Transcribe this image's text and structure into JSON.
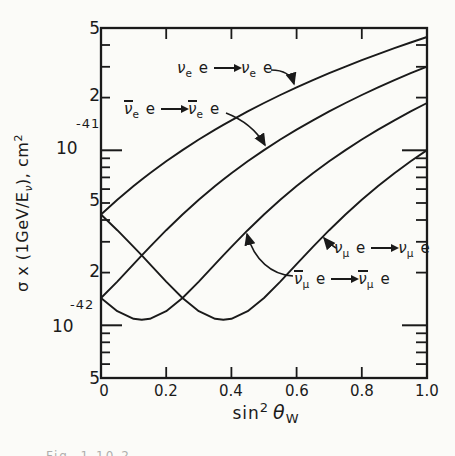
{
  "figure": {
    "paper_color": "#fbfbf8",
    "ink_color": "#1a1a1a",
    "width": 455,
    "height": 456
  },
  "y_axis": {
    "title": {
      "pre": "σ x (1GeV/E",
      "sub": "ν",
      "mid": "), cm",
      "sup": "2"
    },
    "ticks": [
      {
        "label": "5",
        "value_1e42": 50
      },
      {
        "label": "2",
        "value_1e42": 20
      },
      {
        "label": "10",
        "exp": "-41",
        "value_1e42": 10
      },
      {
        "label": "5",
        "value_1e42": 5
      },
      {
        "label": "2",
        "value_1e42": 2
      },
      {
        "label": "10",
        "exp": "-42",
        "value_1e42": 1
      },
      {
        "label": "5",
        "value_1e42": 0.5
      }
    ],
    "minor_1e42": [
      40,
      30,
      20,
      9,
      8,
      7,
      6,
      5,
      4,
      3,
      2,
      0.9,
      0.8,
      0.7,
      0.6
    ],
    "major_1e42": [
      10,
      1
    ],
    "scale": "log"
  },
  "x_axis": {
    "title": {
      "base": "sin",
      "sup": "2",
      "symbol": "θ",
      "sub": "W"
    },
    "ticks": [
      {
        "label": "0",
        "value": 0
      },
      {
        "label": "0.2",
        "value": 0.2
      },
      {
        "label": "0.4",
        "value": 0.4
      },
      {
        "label": "0.6",
        "value": 0.6
      },
      {
        "label": "0.8",
        "value": 0.8
      },
      {
        "label": "1.0",
        "value": 1.0
      }
    ],
    "mark_values": [
      0.2,
      0.4,
      0.6,
      0.8
    ]
  },
  "curve_labels": [
    {
      "nu": "ν",
      "sub": "e",
      "e": "e",
      "barred": false,
      "series": "nu_e"
    },
    {
      "nu": "ν",
      "sub": "e",
      "e": "e",
      "barred": true,
      "series": "nubar_e"
    },
    {
      "nu": "ν",
      "sub": "μ",
      "e": "e",
      "barred": false,
      "series": "nu_mu"
    },
    {
      "nu": "ν",
      "sub": "μ",
      "e": "e",
      "barred": true,
      "series": "nubar_mu"
    }
  ],
  "caption": {
    "fragment": "Fig. 1.10.2"
  },
  "chart_data": {
    "type": "line",
    "title": "",
    "xlabel": "sin^2 θ_W",
    "ylabel": "σ x (1GeV/E_ν), cm^2",
    "y_scale": "log",
    "xlim": [
      0,
      1.0
    ],
    "ylim": [
      5e-43,
      5e-41
    ],
    "grid": false,
    "unit": "1e-42 cm^2",
    "x": [
      0,
      0.05,
      0.1,
      0.125,
      0.15,
      0.2,
      0.25,
      0.3,
      0.35,
      0.375,
      0.4,
      0.45,
      0.5,
      0.55,
      0.6,
      0.65,
      0.7,
      0.75,
      0.8,
      0.85,
      0.9,
      0.95,
      1.0
    ],
    "series": [
      {
        "key": "nu_e",
        "name": "ν_e e → ν_e e",
        "values_1e42": [
          4.3,
          5.217,
          6.249,
          6.808,
          7.396,
          8.657,
          10.033,
          11.524,
          13.129,
          13.975,
          14.849,
          16.684,
          18.633,
          20.697,
          22.876,
          25.169,
          27.577,
          30.1,
          32.737,
          35.489,
          38.356,
          41.337,
          44.433
        ]
      },
      {
        "key": "nubar_e",
        "name": "ν̄_e e → ν̄_e e",
        "values_1e42": [
          1.433,
          1.777,
          2.236,
          2.508,
          2.809,
          3.497,
          4.3,
          5.217,
          6.249,
          6.808,
          7.396,
          8.657,
          10.033,
          11.524,
          13.129,
          14.849,
          16.684,
          18.633,
          20.697,
          22.876,
          25.169,
          27.577,
          30.1
        ]
      },
      {
        "key": "nu_mu",
        "name": "ν_μ e → ν_μ e",
        "values_1e42": [
          4.3,
          3.497,
          2.809,
          2.508,
          2.236,
          1.777,
          1.433,
          1.204,
          1.089,
          1.075,
          1.089,
          1.204,
          1.433,
          1.777,
          2.236,
          2.809,
          3.497,
          4.3,
          5.217,
          6.249,
          7.396,
          8.657,
          10.033
        ]
      },
      {
        "key": "nubar_mu",
        "name": "ν̄_μ e → ν̄_μ e",
        "values_1e42": [
          1.433,
          1.204,
          1.089,
          1.075,
          1.089,
          1.204,
          1.433,
          1.777,
          2.236,
          2.508,
          2.809,
          3.497,
          4.3,
          5.217,
          6.249,
          7.396,
          8.657,
          10.033,
          11.524,
          13.129,
          14.849,
          16.684,
          18.633
        ]
      }
    ]
  }
}
